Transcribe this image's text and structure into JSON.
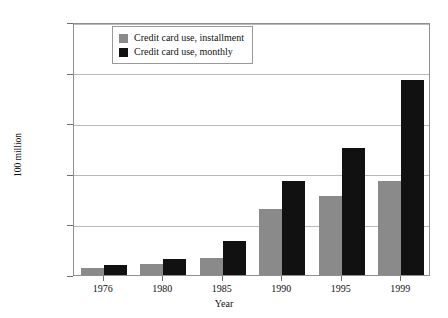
{
  "chart_data": {
    "type": "bar",
    "title": "",
    "xlabel": "Year",
    "ylabel": "100 million",
    "categories": [
      "1976",
      "1980",
      "1985",
      "1990",
      "1995",
      "1999"
    ],
    "series": [
      {
        "name": "Credit card use, installment",
        "color": "#8a8a8a",
        "values": [
          7000,
          11000,
          17000,
          65000,
          78000,
          93000
        ]
      },
      {
        "name": "Credit card use, monthly",
        "color": "#111111",
        "values": [
          10000,
          16000,
          34000,
          93000,
          126000,
          193000
        ]
      }
    ],
    "ylim": [
      0,
      250000
    ],
    "ytick_labels": [
      "250,000",
      "200,000",
      "150,000",
      "100,000",
      "50,000",
      "0"
    ],
    "ytick_values": [
      250000,
      200000,
      150000,
      100000,
      50000,
      0
    ],
    "grid": true,
    "legend_position": "top-left-inside"
  },
  "legend": {
    "items": [
      {
        "label": "Credit card use, installment",
        "color": "#8a8a8a"
      },
      {
        "label": "Credit card use, monthly",
        "color": "#111111"
      }
    ]
  },
  "axes": {
    "x_title": "Year",
    "y_title": "100 million"
  }
}
